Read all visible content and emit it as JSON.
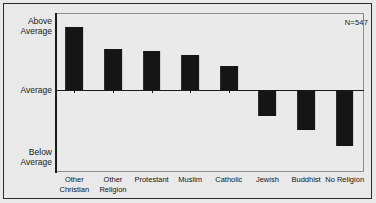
{
  "chart_data": {
    "type": "bar",
    "title": "",
    "subtitle": "",
    "xlabel": "",
    "ylabel": "",
    "categories": [
      "Other\nChristian",
      "Other\nReligion",
      "Protestant",
      "Muslim",
      "Catholic",
      "Jewish",
      "Buddhist",
      "No Religion"
    ],
    "values": [
      0.83,
      0.54,
      0.52,
      0.46,
      0.32,
      -0.34,
      -0.52,
      -0.74
    ],
    "ylim": [
      -1.08,
      1.02
    ],
    "ytick_labels": [
      "Above\nAverage",
      "Average",
      "Below\nAverage"
    ],
    "ytick_values": [
      1.0,
      0.0,
      -1.0
    ],
    "grid": false,
    "legend": "none",
    "annotations": [
      {
        "text": "N=547",
        "position": "top-right"
      }
    ],
    "bar_color": "#151515",
    "plot_background": "#eaeaea",
    "axis_color": "#1c1c1c"
  },
  "figure": {
    "background": "#e9e9e9",
    "border_color": "#2b2b2b"
  }
}
